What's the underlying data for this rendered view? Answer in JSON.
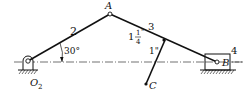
{
  "diagram": {
    "type": "mechanism",
    "labels": {
      "link2": "2",
      "link3": "3",
      "link4": "4",
      "pointA": "A",
      "pointB": "B",
      "pointC": "C",
      "pivotO2": "O",
      "pivotO2_sub": "2",
      "angle": "30°",
      "dim1_whole": "1",
      "dim1_num": "1",
      "dim1_den": "4",
      "dim1_unit": "\"",
      "dim2": "1\""
    },
    "colors": {
      "line": "#111111",
      "centerline": "#333333",
      "background": "#ffffff"
    }
  }
}
